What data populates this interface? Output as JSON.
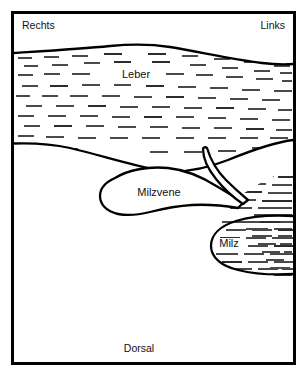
{
  "figure": {
    "type": "anatomical-schematic",
    "language": "de",
    "background_color": "#ffffff",
    "frame": {
      "stroke_color": "#000000",
      "stroke_width": 3,
      "x": 11,
      "y": 11,
      "width": 285,
      "height": 354
    },
    "orientation_labels": {
      "left": "Rechts",
      "right": "Links",
      "bottom": "Dorsal"
    },
    "structures": [
      {
        "id": "leber",
        "label": "Leber",
        "label_x": 136,
        "label_y": 76,
        "hatched": true,
        "outline_color": "#000000"
      },
      {
        "id": "milzvene",
        "label": "Milzvene",
        "label_x": 159,
        "label_y": 192,
        "hatched": false,
        "outline_color": "#000000"
      },
      {
        "id": "milz",
        "label": "Milz",
        "label_x": 228,
        "label_y": 244,
        "hatched": true,
        "outline_color": "#000000"
      }
    ],
    "colors": {
      "ink": "#000000",
      "hatch": "#4a4a4a",
      "paper": "#ffffff"
    }
  }
}
